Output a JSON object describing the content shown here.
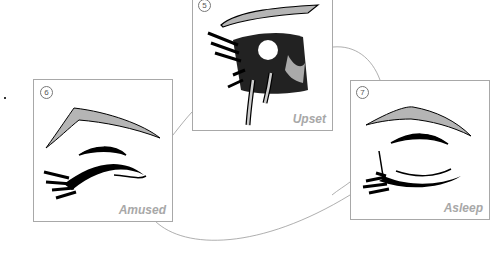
{
  "panels": [
    {
      "id": "upset",
      "number": "5",
      "label": "Upset"
    },
    {
      "id": "amused",
      "number": "6",
      "label": "Amused"
    },
    {
      "id": "asleep",
      "number": "7",
      "label": "Asleep"
    }
  ],
  "colors": {
    "border": "#a8a8a8",
    "caption": "#a8a8a8",
    "ink": "#000000",
    "brow_fill": "#b5b5b5"
  }
}
